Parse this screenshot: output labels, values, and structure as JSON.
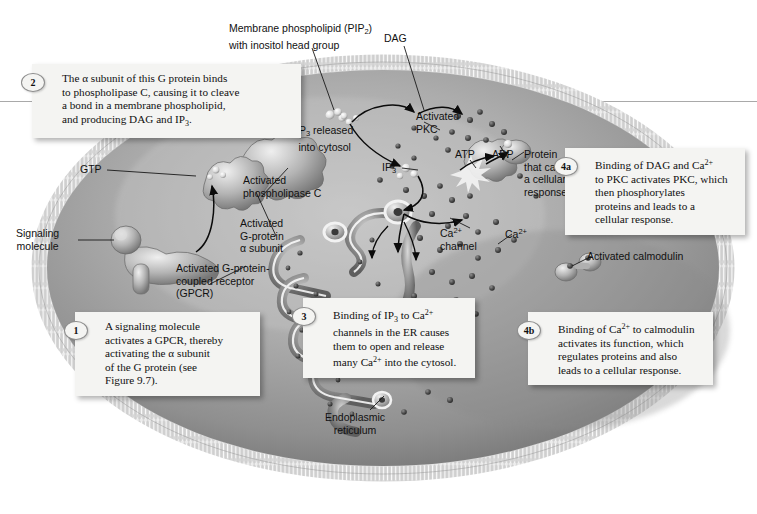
{
  "figure": {
    "background_color": "#ffffff",
    "cell_fill": "#9b9b9b",
    "membrane_color": "#d8d8d8",
    "callout_bg": "#f4f4f2"
  },
  "callouts": [
    {
      "id": "2",
      "badge": "2",
      "text": "The α subunit of this G protein binds to phospholipase C, causing it to cleave a bond in a membrane phospholipid, and producing DAG and IP₃."
    },
    {
      "id": "1",
      "badge": "1",
      "text": "A signaling molecule activates a GPCR, thereby activating the α subunit of the G protein (see Figure 9.7)."
    },
    {
      "id": "3",
      "badge": "3",
      "text": "Binding of IP₃ to Ca²⁺ channels in the ER causes them to open and release many Ca²⁺ into the cytosol."
    },
    {
      "id": "4a",
      "badge": "4a",
      "text": "Binding of DAG and Ca²⁺ to PKC activates PKC, which then phosphorylates proteins and leads to a cellular response."
    },
    {
      "id": "4b",
      "badge": "4b",
      "text": "Binding of Ca²⁺ to calmodulin activates its function, which regulates proteins and also leads to a cellular response."
    }
  ],
  "labels": {
    "membrane_phospholipid": "Membrane phospholipid (PIP₂) with inositol head group",
    "dag": "DAG",
    "gtp": "GTP",
    "signaling_molecule": "Signaling molecule",
    "activated_g_alpha": "Activated G-protein α subunit",
    "activated_gpcr": "Activated G-protein-coupled receptor (GPCR)",
    "activated_plc": "Activated phospholipase C",
    "ip3_released": "IP₃ released into cytosol",
    "ip3": "IP₃",
    "activated_pkc": "Activated PKC",
    "atp": "ATP",
    "adp": "ADP",
    "protein_response": "Protein that causes a cellular response",
    "ca_channel": "Ca²⁺ channel",
    "ca_ion": "Ca²⁺",
    "activated_calmodulin": "Activated calmodulin",
    "endoplasmic_reticulum": "Endoplasmic reticulum"
  }
}
